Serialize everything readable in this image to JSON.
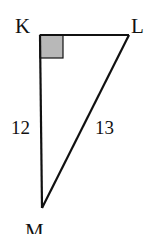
{
  "diagram": {
    "type": "right-triangle",
    "vertices": {
      "K": {
        "label": "K",
        "x": 40,
        "y": 35
      },
      "L": {
        "label": "L",
        "x": 129,
        "y": 35
      },
      "M": {
        "label": "M",
        "x": 42,
        "y": 208
      }
    },
    "right_angle_at": "K",
    "sides": {
      "KM": {
        "label": "12"
      },
      "LM": {
        "label": "13"
      },
      "KL": {
        "label": ""
      }
    },
    "colors": {
      "stroke": "#111111",
      "right_angle_fill": "#b8b8b8"
    }
  }
}
